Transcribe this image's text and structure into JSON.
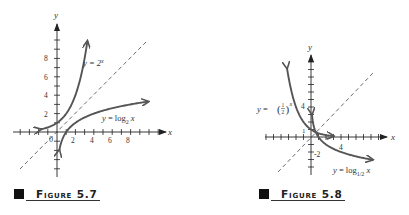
{
  "chart_data": [
    {
      "type": "line",
      "title": "Figure 5.7",
      "xlabel": "x",
      "ylabel": "y",
      "origin_label": "0",
      "x_tick_labels": [
        "2",
        "4",
        "6",
        "8"
      ],
      "y_tick_labels": [
        "2",
        "4",
        "6",
        "8"
      ],
      "xlim": [
        -4.5,
        11.8
      ],
      "ylim": [
        -5,
        11.5
      ],
      "grid": false,
      "series": [
        {
          "name": "y = 2^x",
          "label": "y = 2",
          "label_sup": "x",
          "function": "2^x",
          "x_range": [
            -1.8,
            3.3
          ],
          "color": "#555555"
        },
        {
          "name": "y = log2 x",
          "label": "y = log",
          "label_sub": "2",
          "label_tail": " x",
          "function": "log2(x)",
          "x_range": [
            0.25,
            9.9
          ],
          "color": "#555555"
        },
        {
          "name": "y = x",
          "function": "x",
          "style": "dashed",
          "x_range": [
            -4,
            9.8
          ],
          "color": "#444444"
        }
      ]
    },
    {
      "type": "line",
      "title": "Figure 5.8",
      "xlabel": "x",
      "ylabel": "y",
      "x_tick_labels": [
        "4"
      ],
      "y_tick_labels": [
        "4",
        "1",
        "-2"
      ],
      "xlim": [
        -6,
        10
      ],
      "ylim": [
        -5,
        10.5
      ],
      "grid": false,
      "series": [
        {
          "name": "y = (1/2)^x",
          "label": "y = ",
          "label_frac_num": "1",
          "label_frac_den": "2",
          "label_sup": "x",
          "function": "(1/2)^x",
          "x_range": [
            -3.2,
            3.0
          ],
          "color": "#555555"
        },
        {
          "name": "y = log1/2 x",
          "label": "y = log",
          "label_sub": "1/2",
          "label_tail": " x",
          "function": "log_(1/2)(x)",
          "x_range": [
            0.12,
            8.2
          ],
          "color": "#555555"
        },
        {
          "name": "y = x",
          "function": "x",
          "style": "dashed",
          "x_range": [
            -4.3,
            8.2
          ],
          "color": "#444444"
        }
      ]
    }
  ],
  "captions": {
    "fig1": "Figure 5.7",
    "fig2": "Figure 5.8"
  }
}
